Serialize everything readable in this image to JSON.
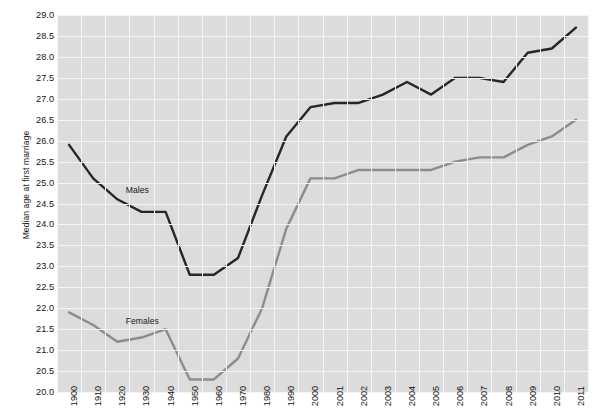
{
  "chart_data": {
    "type": "line",
    "title": "",
    "xlabel": "",
    "ylabel": "Median age at first marriage",
    "ylim": [
      20.0,
      29.0
    ],
    "ytick_step": 0.5,
    "grid": true,
    "legend_position": "inline-annotation",
    "plot_background": "#dcdcdc",
    "gridline_color": "#f4f4f4",
    "categories": [
      "1900",
      "1910",
      "1920",
      "1930",
      "1940",
      "1950",
      "1960",
      "1970",
      "1980",
      "1990",
      "2000",
      "2001",
      "2002",
      "2003",
      "2004",
      "2005",
      "2006",
      "2007",
      "2008",
      "2009",
      "2010",
      "2011"
    ],
    "yticks": [
      "29.0",
      "28.5",
      "28.0",
      "27.5",
      "27.0",
      "26.5",
      "26.0",
      "25.5",
      "25.0",
      "24.5",
      "24.0",
      "23.5",
      "23.0",
      "22.5",
      "22.0",
      "21.5",
      "21.0",
      "20.5",
      "20.0"
    ],
    "series": [
      {
        "name": "Males",
        "color": "#262626",
        "values": [
          25.9,
          25.1,
          24.6,
          24.3,
          24.3,
          22.8,
          22.8,
          23.2,
          24.7,
          26.1,
          26.8,
          26.9,
          26.9,
          27.1,
          27.4,
          27.1,
          27.5,
          27.5,
          27.4,
          28.1,
          28.2,
          28.7
        ]
      },
      {
        "name": "Females",
        "color": "#8c8c8c",
        "values": [
          21.9,
          21.6,
          21.2,
          21.3,
          21.5,
          20.3,
          20.3,
          20.8,
          22.0,
          23.9,
          25.1,
          25.1,
          25.3,
          25.3,
          25.3,
          25.3,
          25.5,
          25.6,
          25.6,
          25.9,
          26.1,
          26.5
        ]
      }
    ],
    "annotations": [
      {
        "text": "Males",
        "x_index": 2.35,
        "value": 24.95
      },
      {
        "text": "Females",
        "x_index": 2.35,
        "value": 21.82
      }
    ]
  }
}
